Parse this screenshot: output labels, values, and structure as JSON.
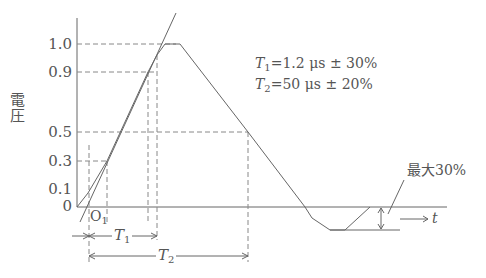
{
  "diagram": {
    "y_axis_label": "電圧",
    "y_ticks": [
      {
        "label": "1.0",
        "value": 1.0
      },
      {
        "label": "0.9",
        "value": 0.9
      },
      {
        "label": "0.5",
        "value": 0.5
      },
      {
        "label": "0.3",
        "value": 0.3
      },
      {
        "label": "0.1",
        "value": 0.1
      },
      {
        "label": "0",
        "value": 0
      }
    ],
    "origin_label": "O",
    "origin_sub": "1",
    "t1": {
      "symbol": "T",
      "sub": "1",
      "equation": "=1.2 μs ± 30%"
    },
    "t2": {
      "symbol": "T",
      "sub": "2",
      "equation": "=50 μs ± 20%"
    },
    "undershoot_label": "最大30%",
    "time_axis_label": "t",
    "colors": {
      "line": "#555555",
      "dash": "#777777",
      "background": "#ffffff"
    }
  }
}
